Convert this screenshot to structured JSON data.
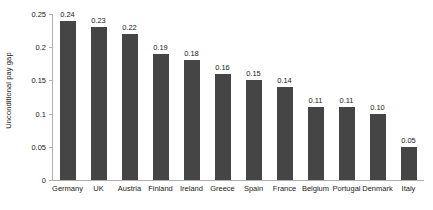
{
  "chart_data": {
    "type": "bar",
    "title": "",
    "xlabel": "",
    "ylabel": "Unconditional pay gap",
    "categories": [
      "Germany",
      "UK",
      "Austria",
      "Finland",
      "Ireland",
      "Greece",
      "Spain",
      "France",
      "Belgium",
      "Portugal",
      "Denmark",
      "Italy"
    ],
    "values": [
      0.24,
      0.23,
      0.22,
      0.19,
      0.18,
      0.16,
      0.15,
      0.14,
      0.11,
      0.11,
      0.1,
      0.05
    ],
    "data_labels": [
      "0.24",
      "0.23",
      "0.22",
      "0.19",
      "0.18",
      "0.16",
      "0.15",
      "0.14",
      "0.11",
      "0.11",
      "0.10",
      "0.05"
    ],
    "ylim": [
      0,
      0.25
    ],
    "yticks": [
      0,
      0.05,
      0.1,
      0.15,
      0.2,
      0.25
    ],
    "ytick_labels": [
      "0",
      "0.05",
      "0.1",
      "0.15",
      "0.2",
      "0.25"
    ],
    "grid": false,
    "legend": null,
    "bar_color": "#454545",
    "axis_color": "#b0b0b0",
    "text_color": "#1a1a1a",
    "background": "#ffffff"
  }
}
